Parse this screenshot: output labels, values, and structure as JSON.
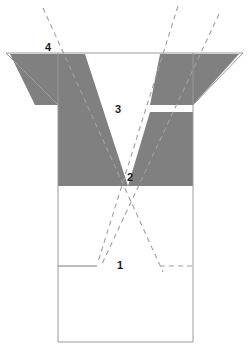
{
  "figure": {
    "title": "",
    "canvas": {
      "width": 249,
      "height": 348,
      "background": "#ffffff"
    },
    "colors": {
      "shaded_fill": "#808080",
      "outline_stroke": "#9a9a9a",
      "dashed_stroke": "#9a9a9a",
      "label_text": "#1a1a1a",
      "background": "#ffffff"
    },
    "labels": [
      {
        "id": "label-1",
        "text": "1",
        "x": 120,
        "y": 266
      },
      {
        "id": "label-2",
        "text": "2",
        "x": 130,
        "y": 178
      },
      {
        "id": "label-3",
        "text": "3",
        "x": 118,
        "y": 110
      },
      {
        "id": "label-4",
        "text": "4",
        "x": 48,
        "y": 48
      }
    ],
    "outline": {
      "name": "funnel-outline",
      "top_line": {
        "x1": 6,
        "y1": 53,
        "x2": 243,
        "y2": 53
      },
      "box": {
        "left": 58,
        "right": 193,
        "top": 53,
        "bottom": 342
      },
      "left_flare": {
        "x1": 6,
        "y1": 53,
        "x2": 58,
        "y2": 105
      },
      "right_flare": {
        "x1": 243,
        "y1": 53,
        "x2": 193,
        "y2": 105
      }
    },
    "shaded_regions": [
      {
        "name": "left-shaded-wedge",
        "fill": "#808080",
        "points": "10,54 85,54 128,186 58,186 58,105 35,105"
      },
      {
        "name": "right-shaded-wedge",
        "fill": "#808080",
        "points": "160,54 239,54 193,105 193,186 128,186 152,105 193,105 193,112 150,112"
      }
    ],
    "dashed_lines": [
      {
        "name": "dashed-line-a",
        "x1": 43,
        "y1": 8,
        "x2": 163,
        "y2": 272
      },
      {
        "name": "dashed-line-b",
        "x1": 178,
        "y1": 6,
        "x2": 98,
        "y2": 262
      },
      {
        "name": "dashed-line-c",
        "x1": 219,
        "y1": 14,
        "x2": 102,
        "y2": 264
      }
    ],
    "solid_segments": [
      {
        "name": "left-base-tick",
        "x1": 58,
        "y1": 266,
        "x2": 97,
        "y2": 266
      }
    ],
    "dashed_segments": [
      {
        "name": "right-base-tick",
        "x1": 160,
        "y1": 266,
        "x2": 193,
        "y2": 266
      }
    ]
  }
}
